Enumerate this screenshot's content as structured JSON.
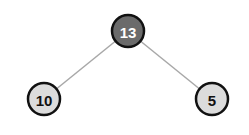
{
  "diagram": {
    "type": "binary-tree",
    "colors": {
      "background": "#ffffff",
      "edge": "#a8a8a8",
      "node_stroke": "#111111",
      "root_fill": "#6b6b6b",
      "root_text": "#ffffff",
      "leaf_fill": "#dcdcdc",
      "leaf_text": "#111111"
    },
    "nodes": [
      {
        "id": "root",
        "label": "13",
        "cx": 128,
        "cy": 31,
        "r": 16,
        "role": "root"
      },
      {
        "id": "left",
        "label": "10",
        "cx": 44,
        "cy": 99,
        "r": 16,
        "role": "leaf"
      },
      {
        "id": "right",
        "label": "5",
        "cx": 212,
        "cy": 99,
        "r": 16,
        "role": "leaf"
      }
    ],
    "edges": [
      {
        "from": "root",
        "to": "left"
      },
      {
        "from": "root",
        "to": "right"
      }
    ]
  }
}
